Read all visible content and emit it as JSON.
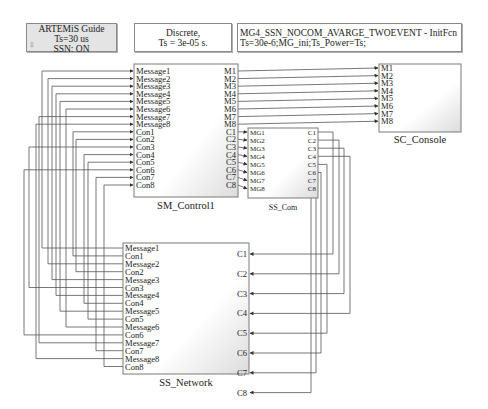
{
  "notes": {
    "artemis": {
      "lines": [
        "ARTEMiS Guide",
        "Ts=30 us",
        "SSN: ON"
      ],
      "icon": "down-arrow-icon"
    },
    "discrete": {
      "lines": [
        "Discrete,",
        "Ts = 3e-05 s."
      ]
    },
    "initfcn": {
      "lines": [
        "MG4_SSN_NOCOM_AVARGE_TWOEVENT - InitFcn",
        "Ts=30e-6;MG_ini;Ts_Power=Ts;"
      ]
    }
  },
  "blocks": {
    "sm_control": {
      "name": "SM_Control1",
      "inputs": [
        "Message1",
        "Message2",
        "Message3",
        "Message4",
        "Message5",
        "Message6",
        "Message7",
        "Message8",
        "Con1",
        "Con2",
        "Con3",
        "Con4",
        "Con5",
        "Con6",
        "Con7",
        "Con8"
      ],
      "outputs": [
        "M1",
        "M2",
        "M3",
        "M4",
        "M5",
        "M6",
        "M7",
        "M8",
        "C1",
        "C2",
        "C3",
        "C4",
        "C5",
        "C6",
        "C7",
        "C8"
      ]
    },
    "sc_console": {
      "name": "SC_Console",
      "inputs": [
        "M1",
        "M2",
        "M3",
        "M4",
        "M5",
        "M6",
        "M7",
        "M8"
      ]
    },
    "ss_com": {
      "name": "SS_Com",
      "inputs": [
        "MG1",
        "MG2",
        "MG3",
        "MG4",
        "MG5",
        "MG6",
        "MG7",
        "MG8"
      ],
      "outputs": [
        "C1",
        "C2",
        "C3",
        "C4",
        "C5",
        "C6",
        "C7",
        "C8"
      ]
    },
    "ss_network": {
      "name": "SS_Network",
      "outputs": [
        "Message1",
        "Con1",
        "Message2",
        "Con2",
        "Message3",
        "Con3",
        "Message4",
        "Con4",
        "Message5",
        "Con5",
        "Message6",
        "Con6",
        "Message7",
        "Con7",
        "Message8",
        "Con8"
      ],
      "inputs": [
        "C1",
        "C2",
        "C3",
        "C4",
        "C5",
        "C6",
        "C7",
        "C8"
      ]
    }
  },
  "colors": {
    "line": "#555555",
    "block_border": "#7a7a7a",
    "note_gray": "#e4e4e4"
  }
}
